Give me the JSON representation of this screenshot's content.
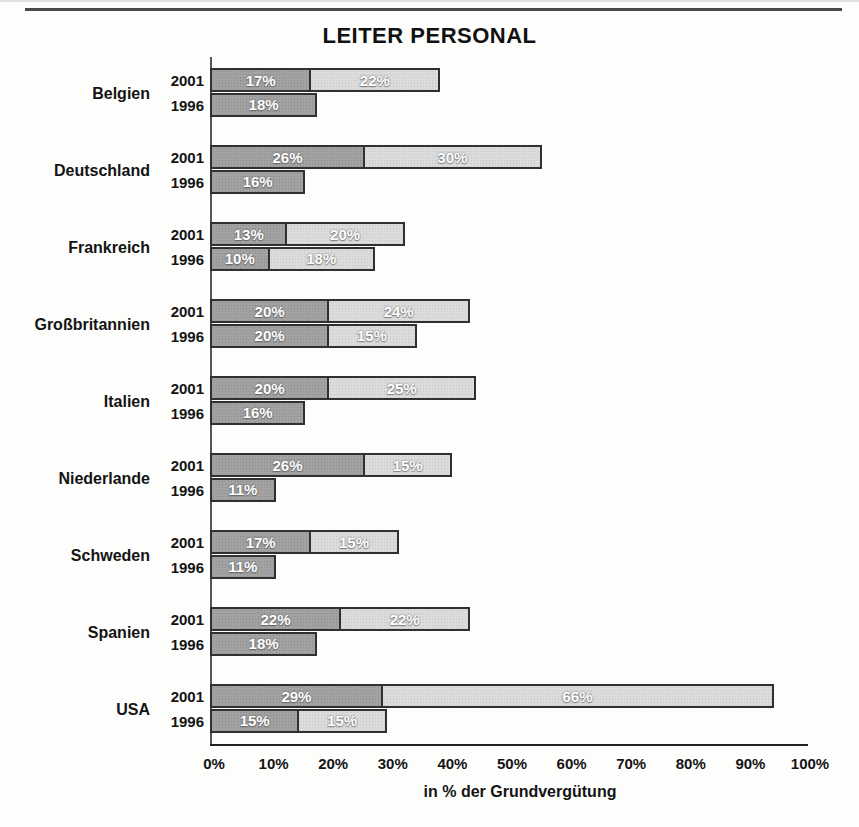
{
  "chart_data": {
    "type": "bar",
    "orientation": "horizontal",
    "stacked": true,
    "title": "LEITER PERSONAL",
    "xlabel": "in % der Grundvergütung",
    "xlim": [
      0,
      100
    ],
    "x_tick_values": [
      0,
      10,
      20,
      30,
      40,
      50,
      60,
      70,
      80,
      90,
      100
    ],
    "x_tick_labels": [
      "0%",
      "10%",
      "20%",
      "30%",
      "40%",
      "50%",
      "60%",
      "70%",
      "80%",
      "90%",
      "100%"
    ],
    "legend": "none",
    "grid": false,
    "value_suffix": "%",
    "groups": [
      {
        "country": "Belgien",
        "bars": [
          {
            "year": "2001",
            "segments": [
              17,
              22
            ]
          },
          {
            "year": "1996",
            "segments": [
              18
            ]
          }
        ]
      },
      {
        "country": "Deutschland",
        "bars": [
          {
            "year": "2001",
            "segments": [
              26,
              30
            ]
          },
          {
            "year": "1996",
            "segments": [
              16
            ]
          }
        ]
      },
      {
        "country": "Frankreich",
        "bars": [
          {
            "year": "2001",
            "segments": [
              13,
              20
            ]
          },
          {
            "year": "1996",
            "segments": [
              10,
              18
            ]
          }
        ]
      },
      {
        "country": "Großbritannien",
        "bars": [
          {
            "year": "2001",
            "segments": [
              20,
              24
            ]
          },
          {
            "year": "1996",
            "segments": [
              20,
              15
            ]
          }
        ]
      },
      {
        "country": "Italien",
        "bars": [
          {
            "year": "2001",
            "segments": [
              20,
              25
            ]
          },
          {
            "year": "1996",
            "segments": [
              16
            ]
          }
        ]
      },
      {
        "country": "Niederlande",
        "bars": [
          {
            "year": "2001",
            "segments": [
              26,
              15
            ]
          },
          {
            "year": "1996",
            "segments": [
              11
            ]
          }
        ]
      },
      {
        "country": "Schweden",
        "bars": [
          {
            "year": "2001",
            "segments": [
              17,
              15
            ]
          },
          {
            "year": "1996",
            "segments": [
              11
            ]
          }
        ]
      },
      {
        "country": "Spanien",
        "bars": [
          {
            "year": "2001",
            "segments": [
              22,
              22
            ]
          },
          {
            "year": "1996",
            "segments": [
              18
            ]
          }
        ]
      },
      {
        "country": "USA",
        "bars": [
          {
            "year": "2001",
            "segments": [
              29,
              66
            ]
          },
          {
            "year": "1996",
            "segments": [
              15,
              15
            ]
          }
        ]
      }
    ],
    "colors": {
      "segment_dark": "#a2a2a2",
      "segment_dark_dot": "#8b8b8b",
      "segment_light": "#dbdbdb",
      "segment_light_dot": "#c8c8c8",
      "segment_border": "#303030",
      "segment_label": "#ffffff",
      "axis": "#444444",
      "text": "#141414"
    }
  }
}
